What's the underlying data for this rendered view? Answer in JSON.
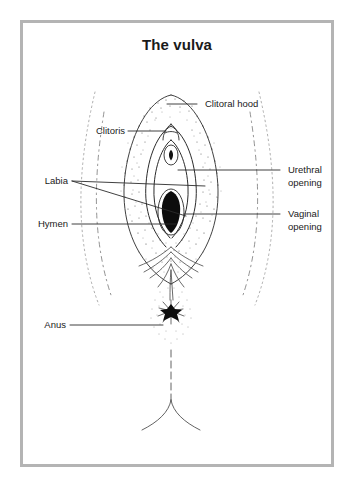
{
  "figure": {
    "title": "The vulva",
    "frame_color": "#b4b4b4",
    "background_color": "#ffffff",
    "ink_color": "#1a1a1a",
    "illustration_style": "stippled line drawing"
  },
  "labels": {
    "clitoral_hood": "Clitoral hood",
    "clitoris": "Clitoris",
    "labia": "Labia",
    "hymen": "Hymen",
    "urethral_opening_line1": "Urethral",
    "urethral_opening_line2": "opening",
    "vaginal_opening_line1": "Vaginal",
    "vaginal_opening_line2": "opening",
    "anus": "Anus"
  }
}
